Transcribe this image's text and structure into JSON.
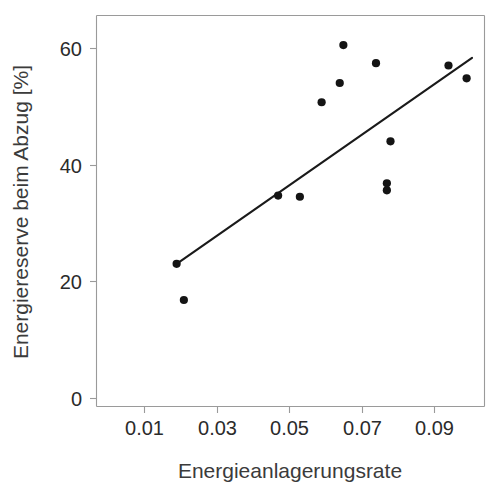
{
  "chart_data": {
    "type": "scatter",
    "title": "",
    "xlabel": "Energieanlagerungsrate",
    "ylabel": "Energiereserve beim Abzug [%]",
    "xlim": [
      0.0035,
      0.1085
    ],
    "ylim": [
      -3.0,
      65.5
    ],
    "grid": false,
    "legend": null,
    "x_tick_labels": [
      "0.01",
      "0.03",
      "0.05",
      "0.07",
      "0.09"
    ],
    "x_tick_values": [
      0.01,
      0.03,
      0.05,
      0.07,
      0.09
    ],
    "y_tick_labels": [
      "0",
      "20",
      "40",
      "60"
    ],
    "y_tick_values": [
      0,
      20,
      40,
      60
    ],
    "series": [
      {
        "name": "Messpunkte",
        "marker": "filled-circle",
        "color": "#141414",
        "points": [
          {
            "x": 0.019,
            "y": 23.0
          },
          {
            "x": 0.021,
            "y": 16.8
          },
          {
            "x": 0.047,
            "y": 34.7
          },
          {
            "x": 0.053,
            "y": 34.5
          },
          {
            "x": 0.059,
            "y": 50.7
          },
          {
            "x": 0.064,
            "y": 54.0
          },
          {
            "x": 0.065,
            "y": 60.5
          },
          {
            "x": 0.074,
            "y": 57.4
          },
          {
            "x": 0.077,
            "y": 36.8
          },
          {
            "x": 0.077,
            "y": 35.6
          },
          {
            "x": 0.078,
            "y": 44.0
          },
          {
            "x": 0.094,
            "y": 57.0
          },
          {
            "x": 0.099,
            "y": 54.8
          }
        ]
      }
    ],
    "fit_line": {
      "name": "Regressionsgerade",
      "color": "#1a1a1a",
      "x_start": 0.019,
      "y_start": 23.0,
      "x_end": 0.1005,
      "y_end": 58.3
    }
  },
  "axes": {
    "x_title": "Energieanlagerungsrate",
    "y_title": "Energiereserve beim Abzug [%]"
  },
  "colors": {
    "marker": "#141414",
    "line": "#1a1a1a",
    "frame": "#9a9a9a",
    "text": "#2b2b2b",
    "background": "#ffffff"
  }
}
